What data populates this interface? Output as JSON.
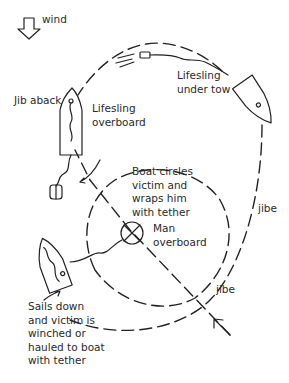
{
  "diagram": {
    "type": "sailing-manoeuvre",
    "wind_label": "wind",
    "labels": {
      "lifesling_under_tow": "Lifesling\nunder tow",
      "jib_aback": "Jib aback",
      "lifesling_overboard": "Lifesling\noverboard",
      "boat_circles": "Boat circles\nvictim and\nwraps him\nwith tether",
      "man_overboard": "Man\noverboard",
      "jibe_upper": "jibe",
      "jibe_lower": "jibe",
      "sails_down": "Sails down\nand victim is\nwinched or\nhauled to boat\nwith tether"
    },
    "icons": {
      "wind": "down-arrow-outline-icon",
      "man_overboard": "circle-cross-icon",
      "boat": "sailboat-hull-icon",
      "lifesling": "lifesling-float-icon",
      "approach": "arrow-icon"
    },
    "ink_color": "#222222"
  }
}
